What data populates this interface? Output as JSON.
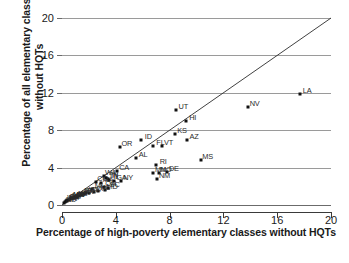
{
  "chart_data": {
    "type": "scatter",
    "title": "",
    "xlabel": "Percentage of high-poverty elementary classes without HQTs",
    "ylabel": "Percentage of all elementary classes without HQTs",
    "xlim": [
      0,
      20
    ],
    "ylim": [
      0,
      20
    ],
    "xticks": [
      0,
      4,
      8,
      12,
      16,
      20
    ],
    "yticks": [
      0,
      4,
      8,
      12,
      16,
      20
    ],
    "grid": "horizontal",
    "legend": "none",
    "reference_line": {
      "type": "identity",
      "from": [
        0,
        0
      ],
      "to": [
        20,
        20
      ]
    },
    "point_labels": "US state abbreviations",
    "points": [
      {
        "label": "LA",
        "x": 17.7,
        "y": 11.9
      },
      {
        "label": "NV",
        "x": 13.8,
        "y": 10.5
      },
      {
        "label": "UT",
        "x": 8.5,
        "y": 10.2
      },
      {
        "label": "HI",
        "x": 9.2,
        "y": 9.0
      },
      {
        "label": "KS",
        "x": 8.4,
        "y": 7.6
      },
      {
        "label": "AZ",
        "x": 9.3,
        "y": 6.9
      },
      {
        "label": "ID",
        "x": 5.9,
        "y": 7.0
      },
      {
        "label": "OR",
        "x": 4.3,
        "y": 6.2
      },
      {
        "label": "FL",
        "x": 6.8,
        "y": 6.3
      },
      {
        "label": "VT",
        "x": 7.4,
        "y": 6.3
      },
      {
        "label": "MS",
        "x": 10.3,
        "y": 4.8
      },
      {
        "label": "AL",
        "x": 5.5,
        "y": 5.0
      },
      {
        "label": "RI",
        "x": 7.0,
        "y": 4.3
      },
      {
        "label": "DE",
        "x": 7.8,
        "y": 3.5
      },
      {
        "label": "MN",
        "x": 6.8,
        "y": 3.4
      },
      {
        "label": "MO",
        "x": 7.2,
        "y": 3.4
      },
      {
        "label": "NM",
        "x": 7.1,
        "y": 2.8
      },
      {
        "label": "CA",
        "x": 4.1,
        "y": 3.6
      },
      {
        "label": "NY",
        "x": 4.4,
        "y": 2.6
      },
      {
        "label": "GA",
        "x": 3.9,
        "y": 2.6
      },
      {
        "label": "WA",
        "x": 3.1,
        "y": 3.1
      },
      {
        "label": "TN",
        "x": 3.3,
        "y": 2.9
      },
      {
        "label": "IL",
        "x": 3.5,
        "y": 2.7
      },
      {
        "label": "IN",
        "x": 3.4,
        "y": 2.8
      },
      {
        "label": "CO",
        "x": 2.5,
        "y": 2.5
      },
      {
        "label": "MA",
        "x": 2.9,
        "y": 2.3
      },
      {
        "label": "OH",
        "x": 3.1,
        "y": 1.9
      },
      {
        "label": "SC",
        "x": 3.4,
        "y": 1.8
      },
      {
        "label": "MD",
        "x": 3.2,
        "y": 1.6
      },
      {
        "label": "NC",
        "x": 2.7,
        "y": 1.5
      },
      {
        "label": "OK",
        "x": 2.4,
        "y": 1.4
      },
      {
        "label": "MI",
        "x": 2.2,
        "y": 1.7
      },
      {
        "label": "TX",
        "x": 2.0,
        "y": 1.3
      },
      {
        "label": "VA",
        "x": 1.8,
        "y": 1.3
      },
      {
        "label": "PA",
        "x": 1.6,
        "y": 1.2
      },
      {
        "label": "WI",
        "x": 1.5,
        "y": 1.1
      },
      {
        "label": "AR",
        "x": 1.4,
        "y": 1.2
      },
      {
        "label": "KY",
        "x": 1.3,
        "y": 1.0
      },
      {
        "label": "IA",
        "x": 1.1,
        "y": 0.9
      },
      {
        "label": "NJ",
        "x": 1.0,
        "y": 0.9
      },
      {
        "label": "CT",
        "x": 0.9,
        "y": 0.8
      },
      {
        "label": "WV",
        "x": 0.8,
        "y": 0.7
      },
      {
        "label": "ME",
        "x": 0.7,
        "y": 0.7
      },
      {
        "label": "MT",
        "x": 0.6,
        "y": 0.6
      },
      {
        "label": "NE",
        "x": 0.5,
        "y": 0.5
      },
      {
        "label": "SD",
        "x": 0.4,
        "y": 0.5
      },
      {
        "label": "NH",
        "x": 0.35,
        "y": 0.4
      },
      {
        "label": "WY",
        "x": 0.3,
        "y": 0.4
      },
      {
        "label": "AK",
        "x": 0.25,
        "y": 0.3
      },
      {
        "label": "ND",
        "x": 0.15,
        "y": 0.2
      }
    ]
  }
}
